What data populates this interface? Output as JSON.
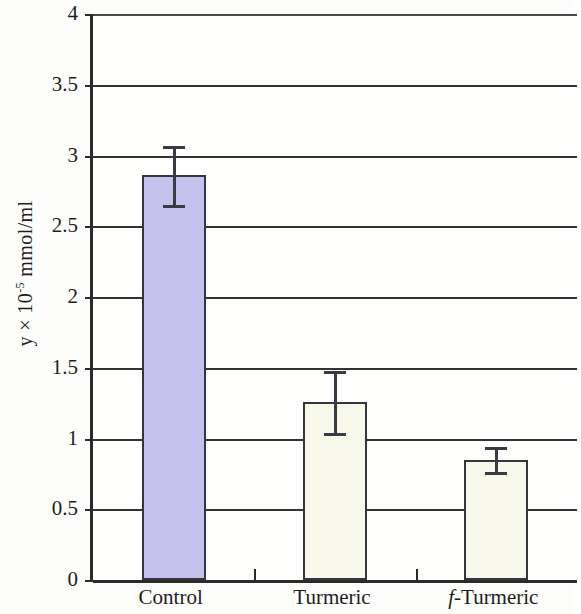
{
  "chart_data": {
    "type": "bar",
    "title": "",
    "xlabel": "",
    "ylabel": "y × 10⁻⁵ mmol/ml",
    "ylabel_parts": {
      "prefix": "y × 10",
      "exponent": "-5",
      "suffix": " mmol/ml"
    },
    "categories": [
      "Control",
      "Turmeric",
      "f-Turmeric"
    ],
    "category_labels_html": [
      "Control",
      "Turmeric",
      "<em>f</em>-Turmeric"
    ],
    "values": [
      2.86,
      1.26,
      0.85
    ],
    "errors": [
      0.21,
      0.22,
      0.09
    ],
    "bar_colors": [
      "#c7c1ee",
      "#f7f7ea",
      "#f7f7ea"
    ],
    "bar_edge_color": "#35353d",
    "error_color": "#3a3a44",
    "ylim": [
      0,
      4
    ],
    "ytick_values": [
      0,
      0.5,
      1,
      1.5,
      2,
      2.5,
      3,
      3.5,
      4
    ],
    "ytick_labels": [
      "0",
      "0.5",
      "1",
      "1.5",
      "2",
      "2.5",
      "3",
      "3.5",
      "4"
    ],
    "grid": true,
    "grid_axis": "y",
    "legend": "none",
    "legend_position": "none"
  }
}
